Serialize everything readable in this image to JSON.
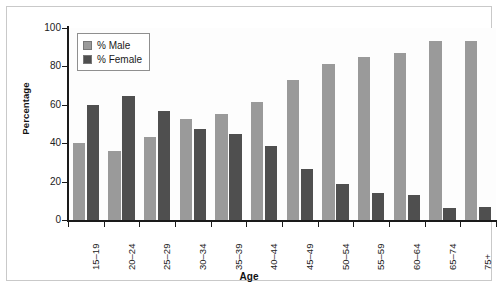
{
  "figure": {
    "background_color": "#ffffff",
    "border_color": "#c9c9c9",
    "top_caption_remnant": ""
  },
  "legend": {
    "position": "top-left-inside",
    "entries": [
      {
        "label": "% Male",
        "color": "#9a9a9a"
      },
      {
        "label": "% Female",
        "color": "#4f4f4f"
      }
    ]
  },
  "axes": {
    "y": {
      "label": "Percentage",
      "ticks": [
        "100",
        "80",
        "60",
        "40",
        "20",
        "0"
      ],
      "min": 0,
      "max": 100
    },
    "x": {
      "label": "Age"
    }
  },
  "chart_data": {
    "type": "bar",
    "title": "",
    "subtitle": "",
    "xlabel": "Age",
    "ylabel": "Percentage",
    "ylim": [
      0,
      100
    ],
    "yticks": [
      0,
      20,
      40,
      60,
      80,
      100
    ],
    "grid": true,
    "grid_axis": "y",
    "legend_position": "upper left",
    "categories": [
      "15–19",
      "20–24",
      "25–29",
      "30–34",
      "35–39",
      "40–44",
      "45–49",
      "50–54",
      "55–59",
      "60–64",
      "65–74",
      "75+"
    ],
    "series": [
      {
        "name": "% Male",
        "color": "#9a9a9a",
        "values": [
          40,
          36,
          43,
          52.5,
          55,
          61.5,
          73,
          81,
          85,
          87,
          93,
          93
        ]
      },
      {
        "name": "% Female",
        "color": "#4f4f4f",
        "values": [
          60,
          64.5,
          57,
          47.5,
          45,
          38.5,
          26.5,
          18.5,
          14,
          13,
          6.5,
          7
        ]
      }
    ]
  }
}
